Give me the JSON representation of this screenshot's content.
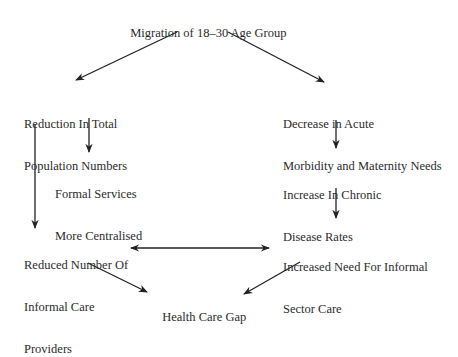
{
  "diagram": {
    "type": "flowchart",
    "nodes": {
      "migration": "Migration of 18–30 Age Group",
      "reduction_line1": "Reduction In Total",
      "reduction_line2": "Population Numbers",
      "decrease_line1": "Decrease in Acute",
      "decrease_line2": "Morbidity and Maternity Needs",
      "formal_line1": "Formal Services",
      "formal_line2": "More Centralised",
      "chronic_line1": "Increase In Chronic",
      "chronic_line2": "Disease Rates",
      "reduced_line1": "Reduced Number Of",
      "reduced_line2": "Informal Care",
      "reduced_line3": "Providers",
      "increased_line1": "Increased Need For Informal",
      "increased_line2": "Sector Care",
      "gap": "Health Care Gap"
    },
    "edges": [
      {
        "from": "Migration of 18–30 Age Group",
        "to": "Reduction In Total Population Numbers"
      },
      {
        "from": "Migration of 18–30 Age Group",
        "to": "Decrease in Acute Morbidity and Maternity Needs"
      },
      {
        "from": "Reduction In Total Population Numbers",
        "to": "Formal Services More Centralised"
      },
      {
        "from": "Reduction In Total Population Numbers",
        "to": "Reduced Number Of Informal Care Providers"
      },
      {
        "from": "Decrease in Acute Morbidity and Maternity Needs",
        "to": "Increase In Chronic Disease Rates"
      },
      {
        "from": "Increase In Chronic Disease Rates",
        "to": "Increased Need For Informal Sector Care"
      },
      {
        "from": "Reduced Number Of Informal Care Providers",
        "to": "Increased Need For Informal Sector Care",
        "bidirectional": true
      },
      {
        "from": "Reduced Number Of Informal Care Providers",
        "to": "Health Care Gap"
      },
      {
        "from": "Increased Need For Informal Sector Care",
        "to": "Health Care Gap"
      }
    ]
  }
}
